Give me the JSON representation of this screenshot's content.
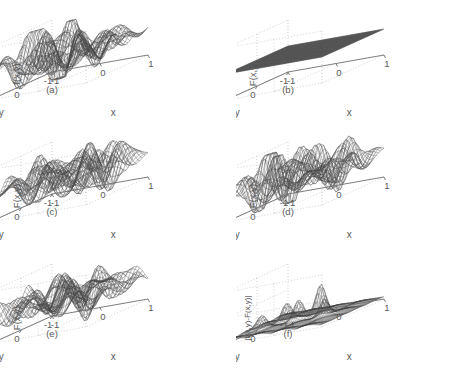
{
  "figure": {
    "width": 473,
    "height": 368,
    "background": "#ffffff",
    "ink_color": "#5a5a5a",
    "mesh_color": "#444444",
    "grid_color": "#bdbdbd",
    "axis_color": "#6e6e6e",
    "rows": 3,
    "cols": 2
  },
  "chart_data": {
    "type": "surface",
    "title": "",
    "shared": {
      "xlabel": "x",
      "ylabel": "y",
      "xlim": [
        -1,
        1
      ],
      "ylim": [
        -1,
        1
      ],
      "xticks": [
        -1,
        0,
        1
      ],
      "yticks": [
        1,
        0,
        -1
      ],
      "grid": true,
      "legend": "none",
      "view": "3d-azimuth-elevation",
      "projection": "oblique"
    },
    "panels": [
      {
        "id": "(a)",
        "row": 0,
        "col": 0,
        "zlabel": "f(x,y)",
        "zlim": [
          -20,
          20
        ],
        "zticks": [
          20,
          0,
          -20
        ],
        "surface": "oscillatory",
        "amplitude": 18,
        "mesh_n": 34,
        "noise": 0.0,
        "flat": false,
        "description": "Original function: dense oscillatory ripples with peaks near +18 and troughs near -18."
      },
      {
        "id": "(b)",
        "row": 0,
        "col": 1,
        "zlabel": "F(x,y)",
        "zlim": [
          -20,
          20
        ],
        "zticks": [
          20,
          0,
          -20
        ],
        "surface": "flat",
        "amplitude": 0,
        "mesh_n": 60,
        "noise": 0.0,
        "flat": true,
        "description": "Reconstruction is identically zero: a dense dark flat plane at z = 0."
      },
      {
        "id": "(c)",
        "row": 1,
        "col": 0,
        "zlabel": "F(x,y)",
        "zlim": [
          -20,
          20
        ],
        "zticks": [
          20,
          0,
          -20
        ],
        "surface": "oscillatory",
        "amplitude": 15,
        "mesh_n": 34,
        "noise": 0.06,
        "flat": false,
        "description": "Partial reconstruction recovering most of the oscillatory structure."
      },
      {
        "id": "(d)",
        "row": 1,
        "col": 1,
        "zlabel": "F(x,y)",
        "zlim": [
          -20,
          20
        ],
        "zticks": [
          20,
          0,
          -20
        ],
        "surface": "oscillatory",
        "amplitude": 16,
        "mesh_n": 34,
        "noise": 0.05,
        "flat": false,
        "description": "Reconstruction closely matching the original surface."
      },
      {
        "id": "(e)",
        "row": 2,
        "col": 0,
        "zlabel": "F(x,y)",
        "zlim": [
          -20,
          20
        ],
        "zticks": [
          20,
          0,
          -20
        ],
        "surface": "oscillatory",
        "amplitude": 17,
        "mesh_n": 34,
        "noise": 0.03,
        "flat": false,
        "description": "Reconstruction nearly identical to the original surface."
      },
      {
        "id": "(f)",
        "row": 2,
        "col": 1,
        "zlabel": "|f(x,y)-F(x,y)|",
        "zlim": [
          0,
          20
        ],
        "zticks": [
          20,
          10,
          0
        ],
        "surface": "error",
        "amplitude": 11,
        "mesh_n": 48,
        "noise": 1.0,
        "flat": false,
        "description": "Absolute error surface: low dark noisy floor near zero with a few sharp spikes reaching about 11."
      }
    ]
  }
}
